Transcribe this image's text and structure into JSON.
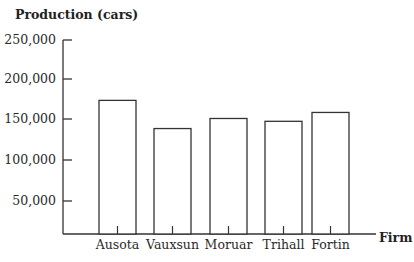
{
  "chart_data": {
    "type": "bar",
    "title": "",
    "ylabel": "Production (cars)",
    "xlabel": "Firm",
    "categories": [
      "Ausota",
      "Vauxsun",
      "Moruar",
      "Trihall",
      "Fortin"
    ],
    "values": [
      175000,
      140000,
      152500,
      149000,
      160000
    ],
    "ylim": [
      0,
      250000
    ],
    "yticks": [
      50000,
      100000,
      150000,
      200000,
      250000
    ],
    "ytick_labels": [
      "50,000",
      "100,000",
      "150,000",
      "200,000",
      "250,000"
    ],
    "grid": false,
    "legend": null,
    "bar_fill": "#ffffff",
    "bar_stroke": "#333333"
  }
}
